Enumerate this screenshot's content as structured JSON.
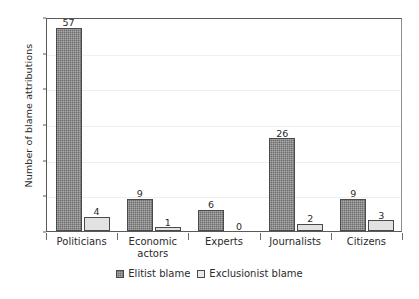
{
  "chart_data": {
    "type": "bar",
    "title": "",
    "xlabel": "",
    "ylabel": "Number of blame attributions",
    "categories": [
      "Politicians",
      "Economic actors",
      "Experts",
      "Journalists",
      "Citizens"
    ],
    "category_lines": [
      [
        "Politicians"
      ],
      [
        "Economic",
        "actors"
      ],
      [
        "Experts"
      ],
      [
        "Journalists"
      ],
      [
        "Citizens"
      ]
    ],
    "series": [
      {
        "name": "Elitist blame",
        "values": [
          57,
          9,
          6,
          26,
          9
        ],
        "color": "#6e6e6e",
        "pattern": "cross-hatch"
      },
      {
        "name": "Exclusionist blame",
        "values": [
          4,
          1,
          0,
          2,
          3
        ],
        "color": "#e2e2e2",
        "pattern": "solid-light"
      }
    ],
    "ylim": [
      0,
      60
    ],
    "yticks": [
      0,
      10,
      20,
      30,
      40,
      50,
      60
    ],
    "ytick_labels": [
      "0",
      "10",
      "20",
      "30",
      "40",
      "50",
      "60"
    ],
    "grid": true,
    "grid_axis": "y",
    "show_data_labels": true,
    "legend_position": "bottom-center",
    "legend_orientation": "horizontal",
    "axis_color": "#5a5a5a",
    "grid_color": "#f0f0f0",
    "background": "#ffffff"
  }
}
